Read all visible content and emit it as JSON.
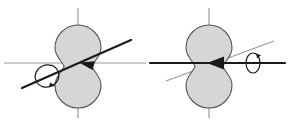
{
  "figure": {
    "background_color": "#ffffff",
    "width": 296,
    "height": 125,
    "colors": {
      "body_fill": "#d6d6d6",
      "body_stroke": "#555555",
      "axis_gray": "#9a9a9a",
      "arrow_dark": "#1b1b1b",
      "rotation_symbol": "#1b1b1b"
    },
    "stroke_widths": {
      "body_outline": 1.1,
      "axis_gray": 1.2,
      "arrow_dark": 2.2,
      "rotation_loop": 1.2
    }
  },
  "panels": [
    {
      "id": "left-panel",
      "name": "left-figure",
      "label": "",
      "body": {
        "name": "peanut-body",
        "shape": "two-tangent-circles",
        "upper_circle": {
          "cx": 78,
          "cy": 48,
          "r": 23
        },
        "lower_circle": {
          "cx": 78,
          "cy": 85,
          "r": 23
        },
        "waist_y": 63,
        "fill": "#d6d6d6",
        "stroke": "#555555"
      },
      "axes": [
        {
          "name": "vertical-axis",
          "orientation": "vertical",
          "color": "#9a9a9a",
          "x1": 78,
          "y1": 8,
          "x2": 78,
          "y2": 118
        },
        {
          "name": "horizontal-axis",
          "orientation": "horizontal",
          "color": "#9a9a9a",
          "x1": 4,
          "y1": 63,
          "x2": 146,
          "y2": 63
        }
      ],
      "rotation_axis": {
        "name": "tilted-rotation-axis",
        "color": "#1b1b1b",
        "x1": 22,
        "y1": 88,
        "x2": 131,
        "y2": 40,
        "arrowhead_at": "center-waist",
        "arrowhead_x": 80,
        "arrowhead_y": 62,
        "angle_deg": -24
      },
      "rotation_symbol": {
        "name": "rotation-loop",
        "type": "ellipse-with-arrow",
        "cx": 47,
        "cy": 76,
        "rx": 12,
        "ry": 11,
        "rotation_deg": -24,
        "direction": "counterclockwise"
      }
    },
    {
      "id": "right-panel",
      "name": "right-figure",
      "label": "",
      "body": {
        "name": "peanut-body",
        "shape": "two-tangent-circles",
        "upper_circle": {
          "cx": 209,
          "cy": 48,
          "r": 23
        },
        "lower_circle": {
          "cx": 209,
          "cy": 85,
          "r": 23
        },
        "waist_y": 63,
        "fill": "#d6d6d6",
        "stroke": "#555555"
      },
      "axes": [
        {
          "name": "vertical-axis",
          "orientation": "vertical",
          "color": "#9a9a9a",
          "x1": 209,
          "y1": 8,
          "x2": 209,
          "y2": 118
        },
        {
          "name": "tilted-gray-axis",
          "orientation": "diagonal",
          "color": "#9a9a9a",
          "x1": 166,
          "y1": 81,
          "x2": 274,
          "y2": 41
        }
      ],
      "rotation_axis": {
        "name": "horizontal-rotation-axis",
        "color": "#1b1b1b",
        "x1": 150,
        "y1": 63,
        "x2": 285,
        "y2": 63,
        "arrowhead_at": "center-waist",
        "arrowhead_x": 211,
        "arrowhead_y": 63,
        "angle_deg": 0
      },
      "rotation_symbol": {
        "name": "rotation-loop",
        "type": "ellipse-with-arrow",
        "cx": 253,
        "cy": 63,
        "rx": 7,
        "ry": 10,
        "rotation_deg": 0,
        "direction": "counterclockwise"
      }
    }
  ]
}
